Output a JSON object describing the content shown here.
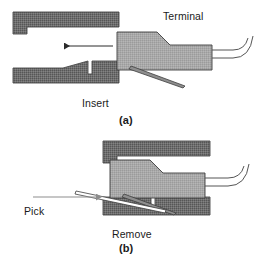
{
  "figure": {
    "labels": {
      "terminal": "Terminal",
      "insert": "Insert",
      "panel_a": "(a)",
      "pick": "Pick",
      "remove": "Remove",
      "panel_b": "(b)"
    },
    "colors": {
      "housing_dark": "#6e6e6e",
      "housing_dark_edge": "#4a4a4a",
      "terminal_light": "#a9a9a9",
      "terminal_edge": "#3d3d3d",
      "wire_line": "#555555",
      "arrow_dark": "#2b2b2b",
      "arrow_gray": "#8d8d8d",
      "background": "#ffffff",
      "text": "#1a1a1a"
    },
    "panels": [
      {
        "id": "a",
        "caption": "(a)",
        "action_label": "Insert",
        "arrow_direction": "left",
        "parts": [
          "connector-housing-upper",
          "connector-housing-lower",
          "terminal-body",
          "terminal-locking-tang",
          "wire"
        ]
      },
      {
        "id": "b",
        "caption": "(b)",
        "action_label": "Remove",
        "arrow_direction": "right",
        "arrow_label": "Pick",
        "parts": [
          "connector-housing-upper",
          "connector-housing-lower",
          "terminal-body",
          "terminal-locking-tang",
          "extraction-pick",
          "wire"
        ]
      }
    ]
  }
}
